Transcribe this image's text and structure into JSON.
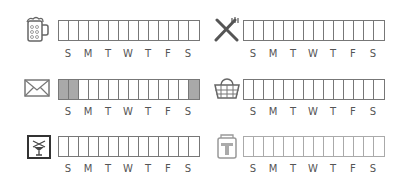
{
  "day_labels": [
    "S",
    "M",
    "T",
    "W",
    "T",
    "F",
    "S"
  ],
  "colors": {
    "border": "#777777",
    "shaded": "#a9a9a9",
    "faint_border": "#aaaaaa",
    "label": "#555555"
  },
  "trackers": [
    {
      "name": "beer",
      "icon": "beer-mug-icon",
      "cells": 14,
      "shaded": []
    },
    {
      "name": "dining",
      "icon": "fork-knife-icon",
      "cells": 14,
      "shaded": []
    },
    {
      "name": "mail",
      "icon": "envelope-icon",
      "cells": 14,
      "shaded": [
        0,
        1,
        13
      ]
    },
    {
      "name": "shopping",
      "icon": "basket-icon",
      "cells": 14,
      "shaded": []
    },
    {
      "name": "nightlife",
      "icon": "cocktail-sign-icon",
      "cells": 14,
      "shaded": []
    },
    {
      "name": "transit",
      "icon": "transit-sign-icon",
      "cells": 14,
      "shaded": []
    }
  ]
}
